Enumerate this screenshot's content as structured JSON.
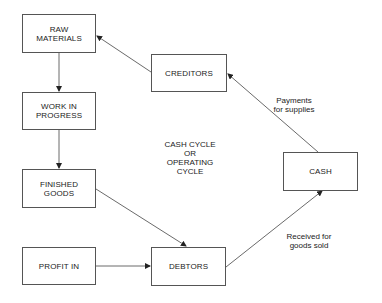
{
  "diagram": {
    "center_label": [
      "CASH CYCLE",
      "OR",
      "OPERATING",
      "CYCLE"
    ],
    "nodes": {
      "raw_materials": [
        "RAW",
        "MATERIALS"
      ],
      "work_in_progress": [
        "WORK IN",
        "PROGRESS"
      ],
      "finished_goods": [
        "FINISHED",
        "GOODS"
      ],
      "profit_in": [
        "PROFIT IN"
      ],
      "creditors": [
        "CREDITORS"
      ],
      "debtors": [
        "DEBTORS"
      ],
      "cash": [
        "CASH"
      ]
    },
    "edge_labels": {
      "payments": [
        "Payments",
        "for supplies"
      ],
      "received": [
        "Received for",
        "goods sold"
      ]
    },
    "edges": [
      {
        "from": "raw_materials",
        "to": "work_in_progress"
      },
      {
        "from": "work_in_progress",
        "to": "finished_goods"
      },
      {
        "from": "finished_goods",
        "to": "debtors"
      },
      {
        "from": "profit_in",
        "to": "debtors"
      },
      {
        "from": "debtors",
        "to": "cash",
        "label": "Received for goods sold"
      },
      {
        "from": "cash",
        "to": "creditors",
        "label": "Payments for supplies"
      },
      {
        "from": "creditors",
        "to": "raw_materials"
      }
    ]
  }
}
